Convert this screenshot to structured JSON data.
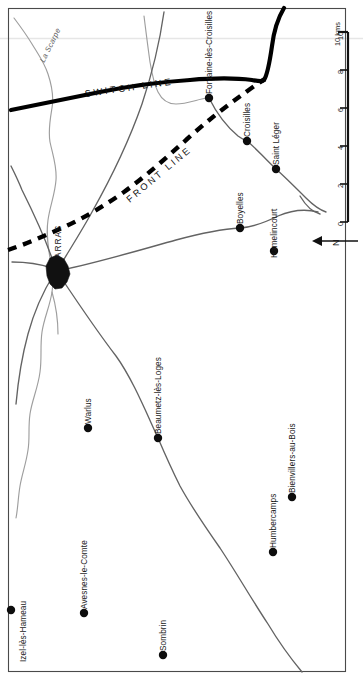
{
  "map": {
    "title": "Arras Sector — Front Line and Switch Line",
    "frame_color": "#4a4a4a",
    "background": "#ffffff",
    "north_arrow": {
      "label": "N",
      "direction": "left"
    },
    "scale_bar": {
      "unit_label": "10 kms",
      "ticks": [
        "0",
        "2",
        "4",
        "6",
        "8",
        "10"
      ],
      "orientation": "vertical"
    },
    "lines": [
      {
        "name": "switch-line",
        "label": "SWITCH LINE",
        "style": "thick-solid",
        "color": "#000000"
      },
      {
        "name": "front-line",
        "label": "FRONT LINE",
        "style": "thick-dashed",
        "color": "#000000"
      }
    ],
    "rivers": [
      {
        "name": "la-scarpe",
        "label": "La Scarpe",
        "color": "#9a9a9a"
      }
    ],
    "city": {
      "name": "arras",
      "label": "ARRAS",
      "type": "urban-area",
      "fill": "#111111"
    },
    "places": [
      {
        "label": "Fontaine-lès-Croisilles",
        "x": 209,
        "y": 98
      },
      {
        "label": "Croisilles",
        "x": 247,
        "y": 141
      },
      {
        "label": "Saint Léger",
        "x": 276,
        "y": 169
      },
      {
        "label": "Boyelles",
        "x": 240,
        "y": 228
      },
      {
        "label": "Hamelincourt",
        "x": 274,
        "y": 251
      },
      {
        "label": "Warlus",
        "x": 88,
        "y": 428
      },
      {
        "label": "Beaumetz-lès-Loges",
        "x": 158,
        "y": 438
      },
      {
        "label": "Bienvillers-au-Bois",
        "x": 292,
        "y": 497
      },
      {
        "label": "Humbercamps",
        "x": 273,
        "y": 552
      },
      {
        "label": "Izel-lès-Hameau",
        "x": 11,
        "y": 610
      },
      {
        "label": "Avesnes-le-Comte",
        "x": 84,
        "y": 613
      },
      {
        "label": "Sombrin",
        "x": 163,
        "y": 655
      }
    ]
  }
}
